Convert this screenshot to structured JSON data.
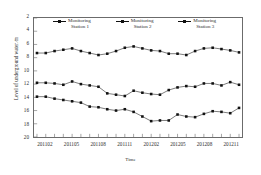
{
  "chart_data": {
    "type": "line",
    "title": "",
    "xlabel": "Time",
    "ylabel": "Level of underground water ∕m",
    "ylim": [
      2,
      20
    ],
    "y_inverted": true,
    "ytick_labels": [
      "2",
      "4",
      "6",
      "8",
      "10",
      "12",
      "14",
      "16",
      "18",
      "20"
    ],
    "ytick_values": [
      2,
      4,
      6,
      8,
      10,
      12,
      14,
      16,
      18,
      20
    ],
    "xtick_labels": [
      "201102",
      "201105",
      "201108",
      "201111",
      "201202",
      "201205",
      "201208",
      "201211"
    ],
    "xtick_indices": [
      1,
      4,
      7,
      10,
      13,
      16,
      19,
      22
    ],
    "grid": false,
    "legend_position": "top-inside",
    "x": [
      "201101",
      "201102",
      "201103",
      "201104",
      "201105",
      "201106",
      "201107",
      "201108",
      "201109",
      "201110",
      "201111",
      "201112",
      "201201",
      "201202",
      "201203",
      "201204",
      "201205",
      "201206",
      "201207",
      "201208",
      "201209",
      "201210",
      "201211",
      "201212"
    ],
    "series": [
      {
        "name": "Monitoring Station 1",
        "marker": "square",
        "color": "#111111",
        "values": [
          7.3,
          7.3,
          7.0,
          6.8,
          6.6,
          7.0,
          7.3,
          7.6,
          7.4,
          7.0,
          6.5,
          6.3,
          6.6,
          6.9,
          7.0,
          7.4,
          7.4,
          7.6,
          7.0,
          6.6,
          6.5,
          6.7,
          6.9,
          7.2
        ]
      },
      {
        "name": "Monitoring Station 2",
        "marker": "square",
        "color": "#111111",
        "values": [
          11.8,
          11.8,
          11.9,
          12.1,
          11.6,
          12.0,
          12.2,
          12.4,
          13.4,
          13.6,
          13.8,
          13.0,
          13.3,
          13.5,
          13.6,
          12.9,
          12.5,
          12.3,
          12.4,
          11.9,
          11.9,
          12.2,
          11.7,
          12.1
        ]
      },
      {
        "name": "Monitoring Station 3",
        "marker": "square",
        "color": "#111111",
        "values": [
          13.9,
          13.9,
          14.2,
          14.4,
          14.6,
          14.8,
          15.4,
          15.5,
          15.8,
          16.0,
          15.8,
          16.2,
          16.9,
          17.6,
          17.5,
          17.5,
          16.6,
          16.9,
          17.0,
          16.5,
          16.1,
          16.2,
          16.4,
          15.6
        ]
      }
    ]
  },
  "legend": {
    "items": [
      {
        "line1": "Monitoring",
        "line2": "Station 1"
      },
      {
        "line1": "Monitoring",
        "line2": "Station 2"
      },
      {
        "line1": "Monitoring",
        "line2": "Station 3"
      }
    ]
  }
}
